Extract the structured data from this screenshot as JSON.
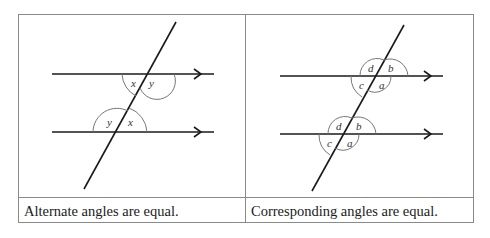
{
  "panels": [
    {
      "id": "alternate",
      "caption": "Alternate angles are equal.",
      "labels": {
        "upper_left": "x",
        "upper_right": "y",
        "lower_left": "y",
        "lower_right": "x"
      }
    },
    {
      "id": "corresponding",
      "caption": "Corresponding angles are equal.",
      "labels": {
        "upper_d": "d",
        "upper_b": "b",
        "upper_c": "c",
        "upper_a": "a",
        "lower_d": "d",
        "lower_b": "b",
        "lower_c": "c",
        "lower_a": "a"
      }
    }
  ],
  "colors": {
    "line": "#1a1a1a",
    "arc": "#777777",
    "border": "#8a8a8a"
  }
}
